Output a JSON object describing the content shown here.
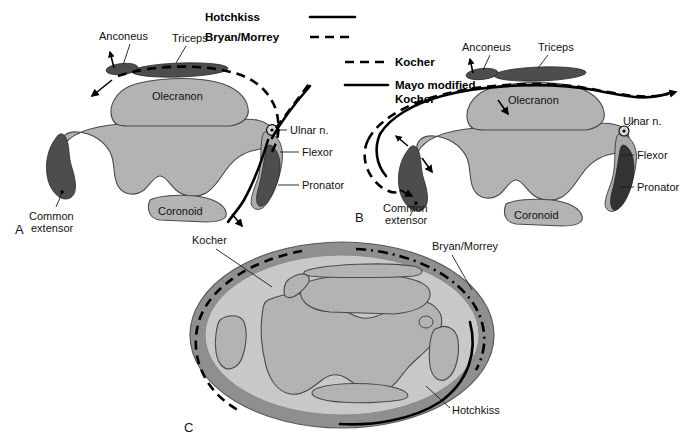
{
  "figure": {
    "title_hidden": "",
    "panels": [
      {
        "id": "A",
        "letter": "A"
      },
      {
        "id": "B",
        "letter": "B"
      },
      {
        "id": "C",
        "letter": "C"
      }
    ]
  },
  "legend_top": {
    "items": [
      {
        "label": "Hotchkiss",
        "style": "solid"
      },
      {
        "label": "Bryan/Morrey",
        "style": "dashed"
      }
    ]
  },
  "legend_mid": {
    "items": [
      {
        "label": "Kocher",
        "style": "dashed"
      },
      {
        "label": "Mayo modified",
        "label2": "Kocher",
        "style": "solid"
      }
    ]
  },
  "panel_a": {
    "letter": "A",
    "labels": {
      "anconeus": "Anconeus",
      "triceps": "Triceps",
      "olecranon": "Olecranon",
      "coronoid": "Coronoid",
      "ulnar": "Ulnar n.",
      "flexor": "Flexor",
      "pronator": "Pronator",
      "common_extensor_1": "Common",
      "common_extensor_2": "extensor"
    }
  },
  "panel_b": {
    "letter": "B",
    "labels": {
      "anconeus": "Anconeus",
      "triceps": "Triceps",
      "olecranon": "Olecranon",
      "coronoid": "Coronoid",
      "ulnar": "Ulnar n.",
      "flexor": "Flexor",
      "pronator": "Pronator",
      "common_extensor_1": "Common",
      "common_extensor_2": "extensor"
    }
  },
  "panel_c": {
    "letter": "C",
    "labels": {
      "kocher": "Kocher",
      "bryan_morrey": "Bryan/Morrey",
      "hotchkiss": "Hotchkiss"
    }
  },
  "colors": {
    "bone_fill": "#b3b3b3",
    "bone_light": "#bdbdbd",
    "muscle_dark": "#4d4d4d",
    "skin_ring": "#8c8c8c",
    "subcutaneous": "#c9c9c9",
    "line": "#000000",
    "background": "#ffffff"
  }
}
